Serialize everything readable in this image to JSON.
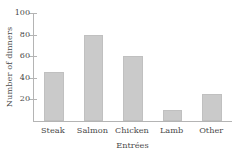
{
  "chart_data": {
    "type": "bar",
    "title": "",
    "xlabel": "Entrées",
    "ylabel": "Number of dinners",
    "categories": [
      "Steak",
      "Salmon",
      "Chicken",
      "Lamb",
      "Other"
    ],
    "values": [
      45,
      80,
      60,
      10,
      25
    ],
    "series": [
      {
        "name": "Number of dinners",
        "values": [
          45,
          80,
          60,
          10,
          25
        ]
      }
    ],
    "ylim": [
      0,
      100
    ],
    "ytick_labels": [
      "20",
      "40",
      "60",
      "80",
      "100"
    ],
    "ytick_values": [
      20,
      40,
      60,
      80,
      100
    ],
    "grid": false,
    "legend": false,
    "legend_position": "none",
    "colors": {
      "bar_fill": "#cacaca",
      "bar_edge": "#c0c0c0",
      "axis": "#b4b4b4",
      "text": "#4a4a4a",
      "background": "#ffffff"
    }
  }
}
